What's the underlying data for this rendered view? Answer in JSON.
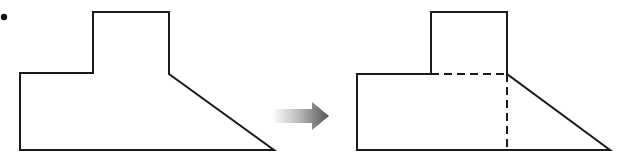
{
  "diagram": {
    "type": "shape-decomposition",
    "bullet": {
      "cx": 4,
      "cy": 17,
      "r": 3
    },
    "stroke_color": "#1a1a1a",
    "arrow": {
      "color_start": "#ffffff",
      "color_end": "#555555",
      "direction": "right"
    },
    "original_shape": {
      "description": "Composite polygon: small rectangle on top of a larger base with a sloped right side",
      "points": "93,12 169,12 169,74 274,150 20,150 20,73 93,73"
    },
    "decomposed_shape": {
      "description": "Same composite shape split by dashed lines into two rectangles and a right triangle",
      "outline_points": "431,12 507,12 507,74 610,150 357,150 357,74 431,74",
      "parts": [
        "top-rectangle",
        "bottom-rectangle",
        "right-triangle"
      ],
      "dashed_lines": [
        {
          "x1": 431,
          "y1": 74,
          "x2": 507,
          "y2": 74
        },
        {
          "x1": 507,
          "y1": 74,
          "x2": 507,
          "y2": 150
        }
      ]
    }
  }
}
